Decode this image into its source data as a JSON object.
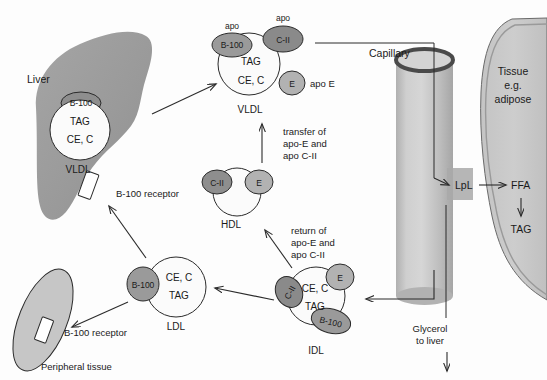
{
  "diagram": {
    "colors": {
      "organ_fill": "#9d9d9d",
      "tissue_fill": "#c9c9c9",
      "capillary_fill": "#bdbdbd",
      "capillary_ring": "#555555",
      "apo_dark": "#8e8e8e",
      "apo_light": "#b4b4b4",
      "particle_fill": "#fbfbfb",
      "stroke": "#2b2b2b",
      "text": "#1a1a1a",
      "lpl_patch": "#a8a8a8"
    },
    "liver": {
      "label": "Liver",
      "receptor_label": "B-100 receptor",
      "particle": {
        "name": "VLDL",
        "core": [
          "TAG",
          "CE, C"
        ],
        "apos": [
          {
            "id": "B-100"
          }
        ]
      }
    },
    "vldl_circulating": {
      "name": "VLDL",
      "core": [
        "TAG",
        "CE, C"
      ],
      "apos": [
        {
          "id": "B-100",
          "caption": "apo"
        },
        {
          "id": "C-II",
          "caption": "apo"
        },
        {
          "id": "E",
          "caption": "apo E"
        }
      ]
    },
    "hdl": {
      "name": "HDL",
      "core": [],
      "apos": [
        {
          "id": "C-II"
        },
        {
          "id": "E"
        }
      ]
    },
    "idl": {
      "name": "IDL",
      "core": [
        "CE, C",
        "TAG"
      ],
      "apos": [
        {
          "id": "C-II"
        },
        {
          "id": "E"
        },
        {
          "id": "B-100"
        }
      ]
    },
    "ldl": {
      "name": "LDL",
      "core": [
        "CE, C",
        "TAG"
      ],
      "apos": [
        {
          "id": "B-100"
        }
      ]
    },
    "peripheral": {
      "label": "Peripheral tissue",
      "receptor_label": "B-100 receptor"
    },
    "capillary": {
      "label": "Capillary",
      "enzyme": "LpL"
    },
    "tissue": {
      "label_line1": "Tissue",
      "label_line2": "e.g.",
      "label_line3": "adipose",
      "products": [
        "FFA",
        "TAG"
      ]
    },
    "glycerol": {
      "line1": "Glycerol",
      "line2": "to liver"
    },
    "annotations": {
      "transfer": [
        "transfer of",
        "apo-E and",
        "apo C-II"
      ],
      "return": [
        "return of",
        "apo-E and",
        "apo C-II"
      ]
    }
  }
}
